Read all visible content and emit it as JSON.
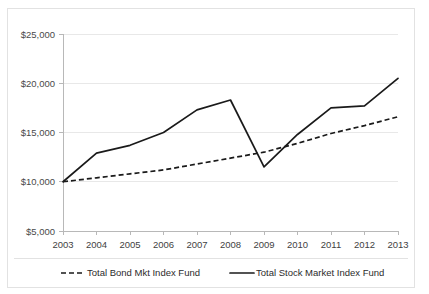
{
  "chart_data": {
    "type": "line",
    "title": "",
    "subtitle": "",
    "xlabel": "",
    "ylabel": "",
    "categories": [
      "2003",
      "2004",
      "2005",
      "2006",
      "2007",
      "2008",
      "2009",
      "2010",
      "2011",
      "2012",
      "2013"
    ],
    "x": [
      2003,
      2004,
      2005,
      2006,
      2007,
      2008,
      2009,
      2010,
      2011,
      2012,
      2013
    ],
    "ylim": [
      5000,
      25000
    ],
    "ytick_values": [
      25000,
      20000,
      15000,
      10000,
      5000
    ],
    "ytick_labels": [
      "$25,000",
      "$20,000",
      "$15,000",
      "$10,000",
      "$5,000"
    ],
    "grid": true,
    "grid_axis": "y",
    "legend_position": "bottom",
    "series": [
      {
        "name": "Total Bond Mkt Index Fund",
        "style": "dashed",
        "color": "#1a1a1a",
        "values": [
          10000,
          10400,
          10800,
          11200,
          11800,
          12400,
          13000,
          13900,
          14900,
          15700,
          16600
        ]
      },
      {
        "name": "Total Stock Market Index Fund",
        "style": "solid",
        "color": "#1a1a1a",
        "values": [
          10000,
          12900,
          13700,
          15000,
          17300,
          18300,
          11500,
          14800,
          17500,
          17700,
          20500
        ]
      }
    ]
  },
  "legend": {
    "items": [
      {
        "label": "Total Bond Mkt Index Fund",
        "style": "dashed"
      },
      {
        "label": "Total Stock Market Index Fund",
        "style": "solid"
      }
    ]
  },
  "colors": {
    "line": "#1a1a1a",
    "grid": "#e8e8e8",
    "axis": "#b8b8b8",
    "border": "#e2e2e2",
    "background": "#ffffff",
    "tick_text": "#4a4a4a"
  }
}
